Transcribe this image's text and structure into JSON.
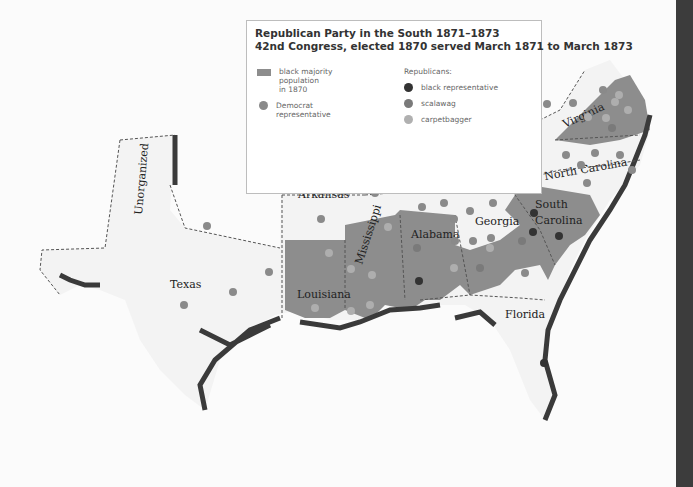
{
  "legend": {
    "title": "Republican Party in the South 1871–1873",
    "subtitle": "42nd Congress, elected 1870 served March 1871 to March 1873",
    "black_majority_label": "black majority\npopulation\nin 1870",
    "democrat_label": "Democrat\nrepresentative",
    "republicans_heading": "Republicans:",
    "black_rep_label": "black representative",
    "scalawag_label": "scalawag",
    "carpetbagger_label": "carpetbagger"
  },
  "colors": {
    "black_majority": "#8d8d8d",
    "democrat": "#8a8a8a",
    "black_representative": "#333333",
    "scalawag": "#7a7a7a",
    "carpetbagger": "#b0b0b0",
    "land": "#f2f2f2",
    "coast": "#3a3a3a"
  },
  "labels": {
    "unorganized": "Unorganized",
    "texas": "Texas",
    "arkansas": "Arkansas",
    "louisiana": "Louisiana",
    "mississippi": "Mississippi",
    "alabama": "Alabama",
    "georgia": "Georgia",
    "florida": "Florida",
    "tennessee": "Tennessee",
    "south_carolina_1": "South",
    "south_carolina_2": "Carolina",
    "north_carolina": "North Carolina",
    "virginia": "Virginia"
  }
}
